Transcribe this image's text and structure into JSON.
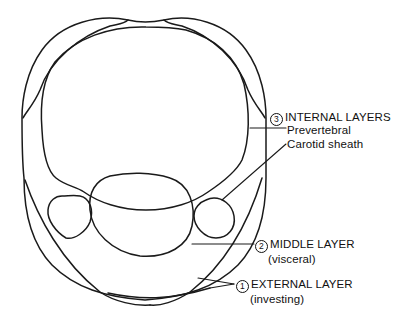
{
  "diagram": {
    "type": "cross-section",
    "colors": {
      "stroke": "#1a1a1a",
      "background": "#ffffff",
      "text": "#111111"
    }
  },
  "labels": {
    "internal": {
      "number": "3",
      "title": "INTERNAL LAYERS",
      "sub1": "Prevertebral",
      "sub2": "Carotid sheath"
    },
    "middle": {
      "number": "2",
      "title": "MIDDLE LAYER",
      "sub": "(visceral)"
    },
    "external": {
      "number": "1",
      "title": "EXTERNAL LAYER",
      "sub": "(investing)"
    }
  }
}
